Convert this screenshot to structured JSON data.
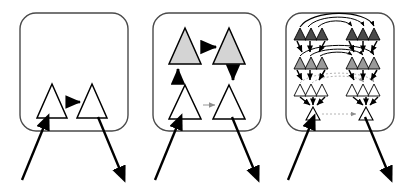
{
  "figure": {
    "type": "recursive-hierarchy-diagram",
    "caption": "",
    "panel_count": 3,
    "background_color": "#ffffff",
    "stroke_color": "#000000",
    "box_stroke_color": "#3a3a3a",
    "dotted_arrow_color": "#b0b0b0",
    "fill_white": "#ffffff",
    "fill_light_gray": "#d4d4d4",
    "fill_mid_gray": "#9a9a9a",
    "fill_dark_gray": "#4a4a4a"
  },
  "panels": [
    {
      "id": "panel-1",
      "label": "",
      "box": {
        "x": 20,
        "y": 13,
        "w": 108,
        "h": 118,
        "rx": 16
      },
      "level_count": 1,
      "nodes": [
        {
          "id": "p1-n1",
          "shape": "triangle",
          "fill": "#ffffff",
          "cx": 52,
          "cy": 101,
          "w": 30,
          "h": 34
        },
        {
          "id": "p1-n2",
          "shape": "triangle",
          "fill": "#ffffff",
          "cx": 92,
          "cy": 101,
          "w": 30,
          "h": 34
        }
      ],
      "internal_arrows": [
        {
          "from": "p1-n1",
          "to": "p1-n2",
          "style": "solid",
          "weight": "bold",
          "direction": "right"
        }
      ],
      "external_arrows": [
        {
          "name": "input-arrow",
          "x1": 22,
          "y1": 180,
          "x2": 46,
          "y2": 118,
          "direction": "up-right"
        },
        {
          "name": "output-arrow",
          "x1": 98,
          "y1": 116,
          "x2": 124,
          "y2": 178,
          "direction": "down-right"
        }
      ]
    },
    {
      "id": "panel-2",
      "label": "",
      "box": {
        "x": 153,
        "y": 13,
        "w": 108,
        "h": 118,
        "rx": 16
      },
      "level_count": 2,
      "nodes": [
        {
          "id": "p2-n1",
          "shape": "triangle",
          "fill": "#d4d4d4",
          "cx": 186,
          "cy": 55,
          "w": 30,
          "h": 36
        },
        {
          "id": "p2-n2",
          "shape": "triangle",
          "fill": "#d4d4d4",
          "cx": 228,
          "cy": 55,
          "w": 30,
          "h": 36
        },
        {
          "id": "p2-n3",
          "shape": "triangle",
          "fill": "#ffffff",
          "cx": 186,
          "cy": 110,
          "w": 30,
          "h": 36
        },
        {
          "id": "p2-n4",
          "shape": "triangle",
          "fill": "#ffffff",
          "cx": 228,
          "cy": 110,
          "w": 30,
          "h": 36
        }
      ],
      "internal_arrows": [
        {
          "from": "p2-n1",
          "to": "p2-n2",
          "style": "solid",
          "weight": "bold",
          "direction": "right"
        },
        {
          "from": "p2-n3",
          "to": "p2-n1",
          "style": "solid",
          "weight": "bold",
          "direction": "up"
        },
        {
          "from": "p2-n2",
          "to": "p2-n4",
          "style": "solid",
          "weight": "bold",
          "direction": "down"
        },
        {
          "from": "p2-n3",
          "to": "p2-n4",
          "style": "dotted",
          "weight": "thin",
          "direction": "right"
        }
      ],
      "external_arrows": [
        {
          "name": "input-arrow",
          "x1": 155,
          "y1": 180,
          "x2": 179,
          "y2": 118,
          "direction": "up-right"
        },
        {
          "name": "output-arrow",
          "x1": 231,
          "y1": 116,
          "x2": 257,
          "y2": 178,
          "direction": "down-right"
        }
      ]
    },
    {
      "id": "panel-3",
      "label": "",
      "box": {
        "x": 286,
        "y": 13,
        "w": 108,
        "h": 118,
        "rx": 16
      },
      "level_count": 4,
      "rows": [
        {
          "level": 1,
          "fill": "#4a4a4a",
          "left_count": 3,
          "right_count": 3,
          "y": 36
        },
        {
          "level": 2,
          "fill": "#9a9a9a",
          "left_count": 3,
          "right_count": 3,
          "y": 66
        },
        {
          "level": 3,
          "fill": "#ffffff",
          "left_count": 3,
          "right_count": 3,
          "y": 94
        },
        {
          "level": 4,
          "fill": "#ffffff",
          "left_count": 1,
          "right_count": 1,
          "y": 116
        }
      ],
      "arcs": [
        {
          "name": "arc-level-1",
          "style": "solid",
          "span": "left-to-right",
          "height": 20
        },
        {
          "name": "arc-level-2",
          "style": "solid",
          "span": "left-to-right",
          "height": 14
        },
        {
          "name": "arc-level-3",
          "style": "solid",
          "span": "left-to-right",
          "height": 9
        }
      ],
      "dotted_arrows": [
        {
          "name": "dotted-level-3",
          "style": "dotted",
          "direction": "right"
        },
        {
          "name": "dotted-level-4",
          "style": "dotted",
          "direction": "right"
        }
      ],
      "external_arrows": [
        {
          "name": "input-arrow",
          "x1": 288,
          "y1": 180,
          "x2": 312,
          "y2": 118,
          "direction": "up-right"
        },
        {
          "name": "output-arrow",
          "x1": 364,
          "y1": 116,
          "x2": 390,
          "y2": 178,
          "direction": "down-right"
        }
      ]
    }
  ]
}
